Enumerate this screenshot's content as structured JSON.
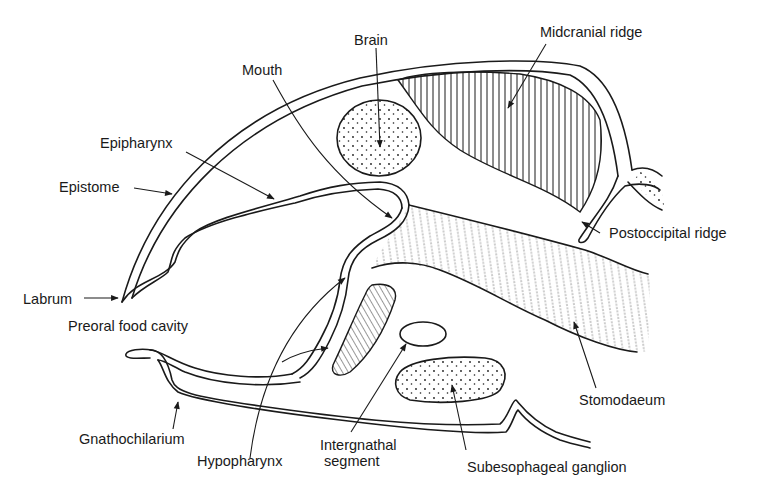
{
  "figure": {
    "type": "anatomical-diagram",
    "labels": [
      {
        "id": "brain",
        "text": "Brain"
      },
      {
        "id": "midcranial_ridge",
        "text": "Midcranial ridge"
      },
      {
        "id": "mouth",
        "text": "Mouth"
      },
      {
        "id": "epipharynx",
        "text": "Epipharynx"
      },
      {
        "id": "epistome",
        "text": "Epistome"
      },
      {
        "id": "postoccipital_ridge",
        "text": "Postoccipital ridge"
      },
      {
        "id": "labrum",
        "text": "Labrum"
      },
      {
        "id": "preoral_food_cavity",
        "text": "Preoral food cavity"
      },
      {
        "id": "stomodaeum",
        "text": "Stomodaeum"
      },
      {
        "id": "gnathochilarium",
        "text": "Gnathochilarium"
      },
      {
        "id": "hypopharynx",
        "text": "Hypopharynx"
      },
      {
        "id": "intergnathal_segment_line1",
        "text": "Intergnathal"
      },
      {
        "id": "intergnathal_segment_line2",
        "text": "segment"
      },
      {
        "id": "subesophageal_ganglion",
        "text": "Subesophageal ganglion"
      }
    ]
  }
}
